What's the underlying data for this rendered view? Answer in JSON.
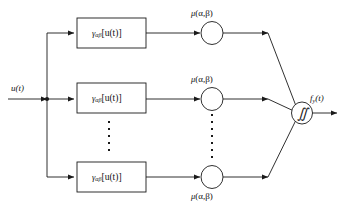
{
  "figure": {
    "type": "block-diagram",
    "input": {
      "label": "u(t)",
      "label_var": "u",
      "label_arg": "(t)"
    },
    "output": {
      "label": "f y (t)",
      "base": "f",
      "sub": "y",
      "arg": "(t)"
    },
    "summing_node": {
      "symbol": "∬",
      "name": "double-integral"
    },
    "branches": [
      {
        "id": "top",
        "operator": {
          "base": "γ",
          "sub": "αβ",
          "arg": "[u(t)]",
          "full": "γαβ[u(t)]"
        },
        "weight": {
          "full": "μ (α,β)",
          "base": "μ",
          "args": "(α,β)",
          "position": "above"
        }
      },
      {
        "id": "middle",
        "operator": {
          "base": "γ",
          "sub": "αβ",
          "arg": "[u(t)]",
          "full": "γαβ[u(t)]"
        },
        "weight": {
          "full": "μ (α,β)",
          "base": "μ",
          "args": "(α,β)",
          "position": "above"
        }
      },
      {
        "id": "bottom",
        "operator": {
          "base": "γ",
          "sub": "αβ",
          "arg": "[u(t)]",
          "full": "γαβ[u(t)]"
        },
        "weight": {
          "full": "μ (α,β)",
          "base": "μ",
          "args": "(α,β)",
          "position": "below"
        }
      }
    ],
    "ellipsis": {
      "operator_column_dots": 5,
      "weight_column_dots": 7
    },
    "caption": "",
    "colors": {
      "stroke": "#1a1a1a",
      "background": "#ffffff",
      "caption": "#9a9a9a"
    }
  }
}
